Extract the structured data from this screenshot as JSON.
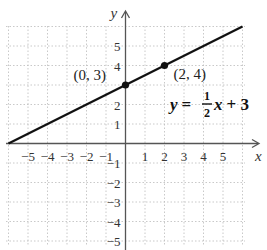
{
  "chart_data": {
    "type": "line",
    "title": "",
    "xlabel": "x",
    "ylabel": "y",
    "xlim": [
      -6,
      6
    ],
    "ylim": [
      -5.5,
      6
    ],
    "grid": true,
    "x_ticks": [
      "−5",
      "−4",
      "−3",
      "−2",
      "−1",
      "1",
      "2",
      "3",
      "4",
      "5"
    ],
    "y_ticks": [
      "5",
      "4",
      "2",
      "1",
      "−1",
      "−2",
      "−3",
      "−4",
      "−5"
    ],
    "series": [
      {
        "name": "y = 1/2 x + 3",
        "slope": 0.5,
        "intercept": 3,
        "x": [
          -6,
          6
        ],
        "y": [
          0,
          6
        ]
      }
    ],
    "points": [
      {
        "label": "(0, 3)",
        "x": 0,
        "y": 3
      },
      {
        "label": "(2, 4)",
        "x": 2,
        "y": 4
      }
    ],
    "equation": {
      "lhs": "y",
      "eq": "=",
      "num": "1",
      "den": "2",
      "var": "x",
      "rest": "+ 3"
    }
  }
}
